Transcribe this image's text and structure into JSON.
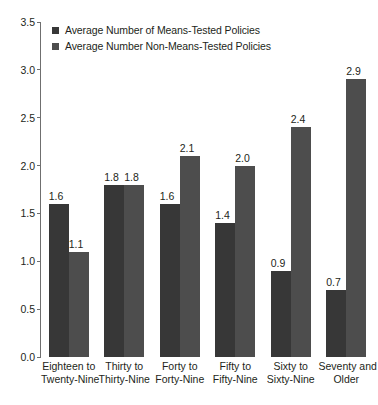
{
  "chart_data": {
    "type": "bar",
    "title": "",
    "xlabel": "",
    "ylabel": "",
    "ylim": [
      0.0,
      3.5
    ],
    "ytick_labels": [
      "0.0",
      "0.5",
      "1.0",
      "1.5",
      "2.0",
      "2.5",
      "3.0",
      "3.5"
    ],
    "ytick_values": [
      0.0,
      0.5,
      1.0,
      1.5,
      2.0,
      2.5,
      3.0,
      3.5
    ],
    "grid": false,
    "legend_position": "top-left",
    "categories": [
      "Eighteen to Twenty-Nine",
      "Thirty to Thirty-Nine",
      "Forty to Forty-Nine",
      "Fifty to Fifty-Nine",
      "Sixty to Sixty-Nine",
      "Seventy and Older"
    ],
    "category_lines": [
      [
        "Eighteen to",
        "Twenty-Nine"
      ],
      [
        "Thirty to",
        "Thirty-Nine"
      ],
      [
        "Forty to",
        "Forty-Nine"
      ],
      [
        "Fifty to",
        "Fifty-Nine"
      ],
      [
        "Sixty to",
        "Sixty-Nine"
      ],
      [
        "Seventy and",
        "Older"
      ]
    ],
    "series": [
      {
        "name": "Average Number of Means-Tested Policies",
        "color": "#373737",
        "values": [
          1.6,
          1.8,
          1.6,
          1.4,
          0.9,
          0.7
        ],
        "labels": [
          "1.6",
          "1.8",
          "1.6",
          "1.4",
          "0.9",
          "0.7"
        ]
      },
      {
        "name": "Average Number Non-Means-Tested Policies",
        "color": "#4d4d4d",
        "values": [
          1.1,
          1.8,
          2.1,
          2.0,
          2.4,
          2.9
        ],
        "labels": [
          "1.1",
          "1.8",
          "2.1",
          "2.0",
          "2.4",
          "2.9"
        ]
      }
    ]
  },
  "axis": {
    "line_color": "#6f6f6f"
  }
}
